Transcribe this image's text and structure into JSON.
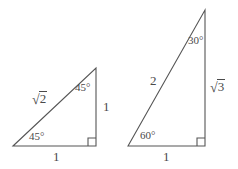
{
  "figure": {
    "stroke_color": "#4a4a4a",
    "background_color": "#ffffff",
    "triangles": [
      {
        "name": "45-45-90-triangle",
        "vertices": {
          "left": [
            13,
            146
          ],
          "top": [
            96,
            68
          ],
          "right": [
            96,
            146
          ]
        },
        "labels": {
          "hypotenuse": {
            "sign": "√",
            "radicand": "2"
          },
          "vertical_leg": "1",
          "horizontal_leg": "1",
          "angle_top": "45°",
          "angle_left": "45°",
          "right_angle_marker": "square"
        }
      },
      {
        "name": "30-60-90-triangle",
        "vertices": {
          "left": [
            128,
            146
          ],
          "top": [
            205,
            10
          ],
          "right": [
            205,
            146
          ]
        },
        "labels": {
          "hypotenuse": "2",
          "vertical_leg": {
            "sign": "√",
            "radicand": "3"
          },
          "horizontal_leg": "1",
          "angle_top": "30°",
          "angle_left": "60°",
          "right_angle_marker": "square"
        }
      }
    ]
  },
  "labels": {
    "t1_hyp_sign": "√",
    "t1_hyp_radicand": "2",
    "t1_vert": "1",
    "t1_horiz": "1",
    "t1_angle_top": "45°",
    "t1_angle_left": "45°",
    "t2_hyp": "2",
    "t2_vert_sign": "√",
    "t2_vert_radicand": "3",
    "t2_horiz": "1",
    "t2_angle_top": "30°",
    "t2_angle_left": "60°"
  }
}
